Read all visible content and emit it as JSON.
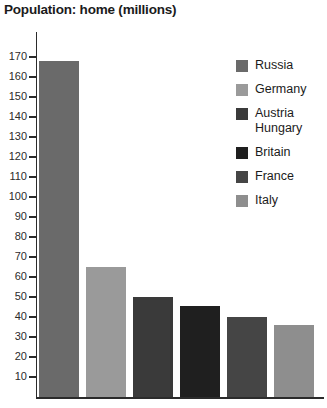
{
  "chart_data": {
    "type": "bar",
    "title": "Population: home (millions)",
    "xlabel": "",
    "ylabel": "",
    "ylim": [
      0,
      170
    ],
    "ytick_step": 10,
    "grid": false,
    "legend_position": "right",
    "categories": [
      "Russia",
      "Germany",
      "Austria Hungary",
      "Britain",
      "France",
      "Italy"
    ],
    "values": [
      168,
      65,
      50,
      45.5,
      40,
      36
    ],
    "ytick_labels": [
      "170",
      "160",
      "150",
      "140",
      "130",
      "120",
      "110",
      "100",
      "90",
      "80",
      "70",
      "60",
      "50",
      "40",
      "30",
      "20",
      "10"
    ],
    "ytick_values": [
      170,
      160,
      150,
      140,
      130,
      120,
      110,
      100,
      90,
      80,
      70,
      60,
      50,
      40,
      30,
      20,
      10
    ],
    "bars": [
      {
        "label": "Russia",
        "value": 168,
        "color": "#6a6a6a"
      },
      {
        "label": "Germany",
        "value": 65,
        "color": "#9a9a9a"
      },
      {
        "label": "Austria Hungary",
        "value": 50,
        "color": "#3a3a3a"
      },
      {
        "label": "Britain",
        "value": 45.5,
        "color": "#1f1f1f"
      },
      {
        "label": "France",
        "value": 40,
        "color": "#454545"
      },
      {
        "label": "Italy",
        "value": 36,
        "color": "#8e8e8e"
      }
    ]
  },
  "legend": {
    "items": [
      {
        "label": "Russia",
        "color": "#6a6a6a"
      },
      {
        "label": "Germany",
        "color": "#9a9a9a"
      },
      {
        "label": "Austria\nHungary",
        "color": "#3a3a3a"
      },
      {
        "label": "Britain",
        "color": "#1f1f1f"
      },
      {
        "label": "France",
        "color": "#454545"
      },
      {
        "label": "Italy",
        "color": "#8e8e8e"
      }
    ]
  },
  "colors": {
    "axis": "#2b2b2b",
    "text": "#1b1b1b",
    "background": "#ffffff"
  }
}
